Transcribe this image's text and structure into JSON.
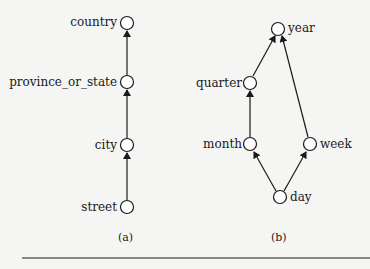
{
  "diagram_a": {
    "caption": "(a)",
    "nodes": [
      "country",
      "province_or_state",
      "city",
      "street"
    ],
    "edges": [
      [
        "street",
        "city"
      ],
      [
        "city",
        "province_or_state"
      ],
      [
        "province_or_state",
        "country"
      ]
    ]
  },
  "diagram_b": {
    "caption": "(b)",
    "nodes": [
      "year",
      "quarter",
      "month",
      "week",
      "day"
    ],
    "edges": [
      [
        "day",
        "month"
      ],
      [
        "day",
        "week"
      ],
      [
        "month",
        "quarter"
      ],
      [
        "quarter",
        "year"
      ],
      [
        "week",
        "year"
      ]
    ]
  },
  "colors": {
    "line": "#1a1a1a",
    "background": "#f5f5f3"
  }
}
